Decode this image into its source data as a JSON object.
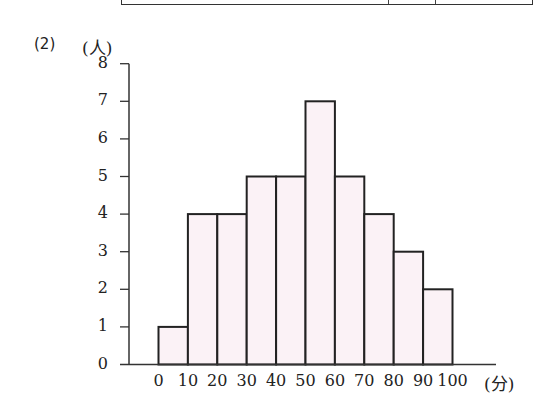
{
  "question_number": "(2)",
  "y_unit_label": "(人)",
  "x_unit_label": "(分)",
  "colors": {
    "bar_fill": "#fbf2f6",
    "bar_stroke": "#222222",
    "axis": "#333333"
  },
  "chart_data": {
    "type": "bar",
    "subtype": "histogram",
    "title": "",
    "xlabel": "(分)",
    "ylabel": "(人)",
    "bin_edges": [
      0,
      10,
      20,
      30,
      40,
      50,
      60,
      70,
      80,
      90,
      100
    ],
    "categories": [
      "0-10",
      "10-20",
      "20-30",
      "30-40",
      "40-50",
      "50-60",
      "60-70",
      "70-80",
      "80-90",
      "90-100"
    ],
    "values": [
      1,
      4,
      4,
      5,
      5,
      7,
      5,
      4,
      3,
      2
    ],
    "ylim": [
      0,
      8
    ],
    "yticks": [
      "0",
      "1",
      "2",
      "3",
      "4",
      "5",
      "6",
      "7",
      "8"
    ],
    "xticks": [
      "0",
      "10",
      "20",
      "30",
      "40",
      "50",
      "60",
      "70",
      "80",
      "90",
      "100"
    ],
    "grid": false,
    "legend": null
  }
}
